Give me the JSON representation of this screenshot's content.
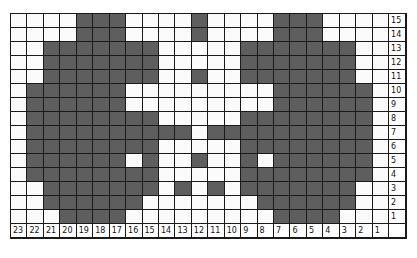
{
  "chart_title": "",
  "colors": {
    "filled": "#5e5e5e",
    "empty": "#fbfbfb",
    "grid_line": "#1a1a1a"
  },
  "column_labels": [
    "23",
    "22",
    "21",
    "20",
    "19",
    "18",
    "17",
    "16",
    "15",
    "14",
    "13",
    "12",
    "11",
    "10",
    "9",
    "8",
    "7",
    "6",
    "5",
    "4",
    "3",
    "2",
    "1",
    ""
  ],
  "row_labels": [
    "15",
    "14",
    "13",
    "12",
    "11",
    "10",
    "9",
    "8",
    "7",
    "6",
    "5",
    "4",
    "3",
    "2",
    "1"
  ],
  "rows": [
    {
      "row": 15,
      "cells": "....###....#....###...."
    },
    {
      "row": 14,
      "cells": "....###....#....###...."
    },
    {
      "row": 13,
      "cells": "..#######.....#######.."
    },
    {
      "row": 12,
      "cells": "..#######.....#######.."
    },
    {
      "row": 11,
      "cells": "..#######..#..#######.."
    },
    {
      "row": 10,
      "cells": ".######.........######."
    },
    {
      "row": 9,
      "cells": ".######.........######."
    },
    {
      "row": 8,
      "cells": ".########.....########."
    },
    {
      "row": 7,
      "cells": ".##########.##########."
    },
    {
      "row": 6,
      "cells": ".########.....########."
    },
    {
      "row": 5,
      "cells": ".######.#..#..#.######."
    },
    {
      "row": 4,
      "cells": ".########.....########."
    },
    {
      "row": 3,
      "cells": "..#######.#.#.#######.."
    },
    {
      "row": 2,
      "cells": "..######.......######.."
    },
    {
      "row": 1,
      "cells": "...####.........####..."
    }
  ],
  "legend": {
    "#": "filled stitch (dark)",
    ".": "empty stitch (white)"
  }
}
